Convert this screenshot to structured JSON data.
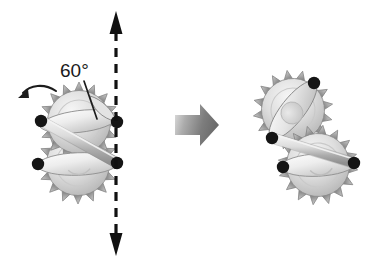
{
  "figure": {
    "kind": "mechanical-diagram",
    "background_color": "#ffffff"
  },
  "annotations": {
    "angle_label": "60°",
    "angle_label_color": "#1a1a1a",
    "rotation_arrow_name": "counter-clockwise rotation arrow",
    "reference_axis_name": "vertical dashed reference axis",
    "transition_arrow_name": "transition block arrow"
  },
  "left_assembly": {
    "name": "initial-position-assembly",
    "upper_gear": {
      "label": "upper sprocket gear",
      "center_x": 79,
      "center_y": 122,
      "radius": 40,
      "teeth": 16,
      "arm_angle_deg": -6,
      "pivots": [
        {
          "name": "upper-left-pivot",
          "x": 41,
          "y": 121
        },
        {
          "name": "upper-right-pivot",
          "x": 117,
          "y": 122
        }
      ]
    },
    "lower_gear": {
      "label": "lower sprocket gear",
      "center_x": 78,
      "center_y": 164,
      "radius": 40,
      "teeth": 16,
      "arm_angle_deg": -2,
      "pivots": [
        {
          "name": "lower-left-pivot",
          "x": 38,
          "y": 164
        },
        {
          "name": "lower-right-pivot",
          "x": 117,
          "y": 163
        }
      ]
    },
    "connecting_rod": {
      "label": "connecting rod",
      "from_x": 41,
      "from_y": 121,
      "to_x": 117,
      "to_y": 163
    }
  },
  "right_assembly": {
    "name": "rotated-position-assembly",
    "upper_gear": {
      "label": "upper sprocket gear rotated",
      "center_x": 293,
      "center_y": 110,
      "radius": 40,
      "teeth": 16,
      "arm_angle_deg": -52,
      "pivots": [
        {
          "name": "upper-right-pivot",
          "x": 314,
          "y": 83
        },
        {
          "name": "upper-left-pivot",
          "x": 272,
          "y": 138
        }
      ]
    },
    "lower_gear": {
      "label": "lower sprocket gear rotated",
      "center_x": 318,
      "center_y": 165,
      "radius": 40,
      "teeth": 16,
      "arm_angle_deg": -3,
      "pivots": [
        {
          "name": "lower-left-pivot",
          "x": 283,
          "y": 167
        },
        {
          "name": "lower-right-pivot",
          "x": 354,
          "y": 163
        }
      ]
    },
    "connecting_rod": {
      "label": "connecting rod",
      "from_x": 272,
      "from_y": 138,
      "to_x": 354,
      "to_y": 163
    }
  },
  "reference_axis": {
    "x": 116,
    "top_y": 12,
    "bottom_y": 256,
    "color": "#111111",
    "dash": "9 7",
    "width": 3
  },
  "transition_arrow": {
    "x": 175,
    "y": 104,
    "width": 44,
    "height": 42,
    "color_light": "#d8d8d8",
    "color_dark": "#6f6f6f"
  },
  "palette": {
    "gear_teeth": "#b4b4b4",
    "gear_teeth_dark": "#8e8e8e",
    "gear_body_light": "#f2f2f2",
    "gear_body_mid": "#d2d2d2",
    "gear_body_dark": "#a9a9a9",
    "arm_light": "#fafafa",
    "arm_mid": "#d9d9d9",
    "rod_light": "#e6e6e6",
    "rod_dark": "#9a9a9a",
    "outline": "#6b6b6b",
    "pivot": "#151515"
  }
}
